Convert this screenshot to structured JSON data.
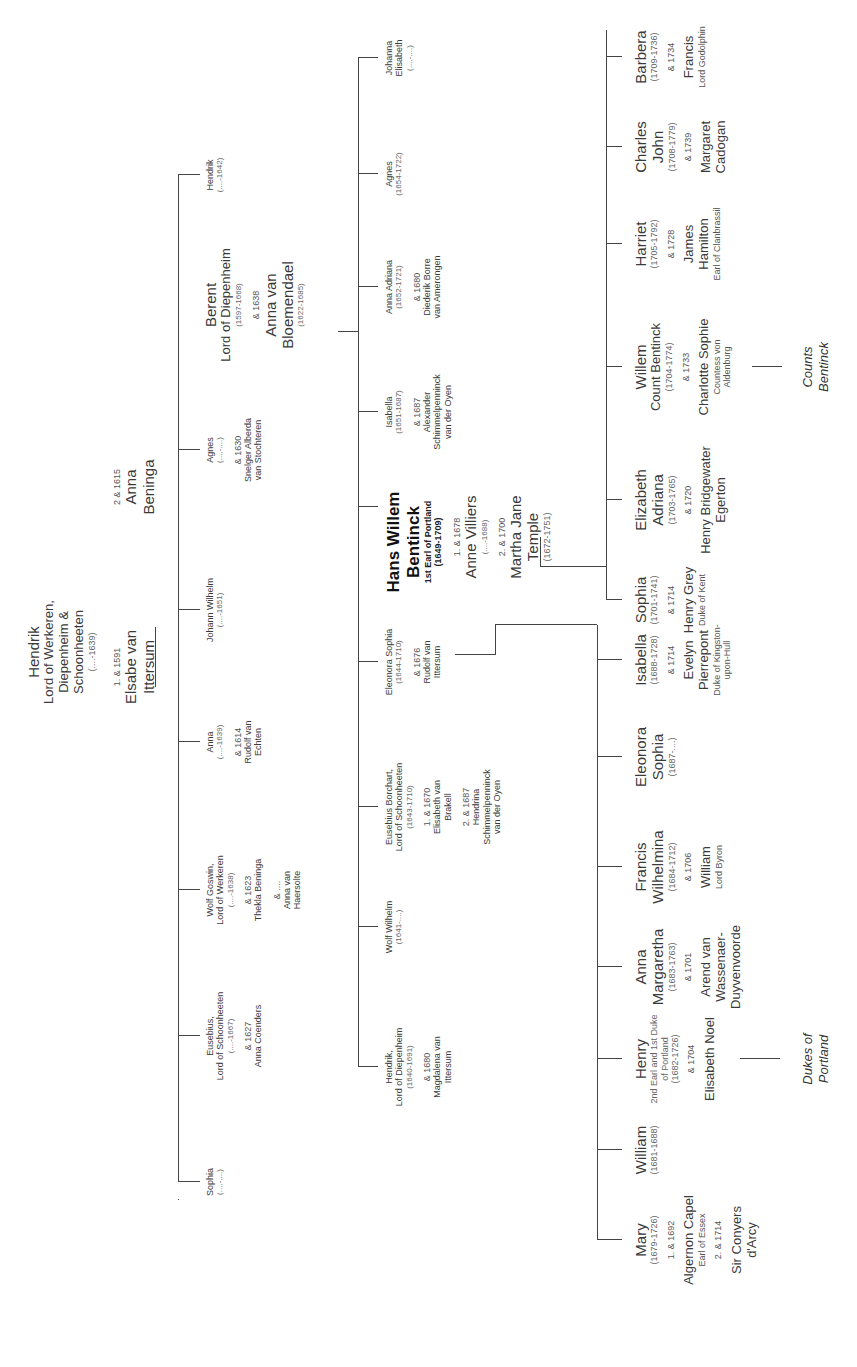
{
  "root": {
    "name": "Hendrik",
    "title_lines": [
      "Lord of Werkeren,",
      "Diepenheim &",
      "Schoonheeten"
    ],
    "years": "(....-1639)",
    "marriage1": "1. & 1591",
    "spouse1": [
      "Elsabe van",
      "Ittersum"
    ],
    "marriage2": "2 & 1615",
    "spouse2": [
      "Anna",
      "Beninga"
    ]
  },
  "generation2": [
    {
      "name": "Sophia",
      "years": "(....-....)"
    },
    {
      "name": "Eusebius,",
      "sub": "Lord of Schoonheeten",
      "years": "(....-1667)",
      "marriage": "& 1627",
      "spouse": [
        "Anna Coenders"
      ]
    },
    {
      "name": "Wolf Goswin,",
      "sub": "Lord of Werkeren",
      "years": "(....-1638)",
      "marriage": "& 1623",
      "spouse": [
        "Thekla Beninga"
      ],
      "marriage2": "& ....",
      "spouse2": [
        "Anna van",
        "Haersolte"
      ]
    },
    {
      "name": "Anna",
      "years": "(....-1639)",
      "marriage": "& 1614",
      "spouse": [
        "Rudolf van",
        "Echten"
      ]
    },
    {
      "name": "Johann Wilhelm",
      "years": "(....-1651)"
    },
    {
      "name": "Agnes",
      "years": "(....-....)",
      "marriage": "& 1630",
      "spouse": [
        "Snelger Alberda",
        "van Stochteren"
      ]
    },
    {
      "name": "Berent",
      "sub": "Lord of Diepenheim",
      "years": "(1597-1668)",
      "marriage": "& 1638",
      "spouse": [
        "Anna van",
        "Bloemendael"
      ],
      "spouse_years": "(1622-1685)"
    },
    {
      "name": "Hendrik",
      "years": "(....-1642)"
    }
  ],
  "generation3": [
    {
      "name": "Hendrik,",
      "sub": "Lord of Diepenheim",
      "years": "(1640-1691)",
      "marriage": "& 1680",
      "spouse": [
        "Magdalena van",
        "Ittersum"
      ]
    },
    {
      "name": "Wolf Wilhelm",
      "years": "(1641-....)"
    },
    {
      "name": "Eusebius Borchart,",
      "sub": "Lord of Schoonheeten",
      "years": "(1643-1710)",
      "marriage": "1. & 1670",
      "spouse": [
        "Elisabeth van",
        "Brakell"
      ],
      "marriage2": "2. & 1687",
      "spouse2": [
        "Hendrina",
        "Schimmelpenninck",
        "van der Oyen"
      ]
    },
    {
      "name": "Eleonora Sophia",
      "years": "(1644-1710)",
      "marriage": "& 1676",
      "spouse": [
        "Rudolf van",
        "Ittersum"
      ]
    },
    {
      "name": "Hans Willem",
      "name2": "Bentinck",
      "sub": "1st Earl of Portland",
      "years": "(1649-1709)",
      "marriage": "1. & 1678",
      "spouse": [
        "Anne Villiers"
      ],
      "spouse_years": "(....-1688)",
      "marriage2": "2. & 1700",
      "spouse2": [
        "Martha Jane",
        "Temple"
      ],
      "spouse2_years": "(1672-1751)"
    },
    {
      "name": "Isabella",
      "years": "(1651-1687)",
      "marriage": "& 1687",
      "spouse": [
        "Alexander",
        "Schimmelpenninck",
        "van der Oyen"
      ]
    },
    {
      "name": "Anna Adriana",
      "years": "(1652-1721)",
      "marriage": "& 1680",
      "spouse": [
        "Diederik Borre",
        "van Amerongen"
      ]
    },
    {
      "name": "Agnes",
      "years": "(1654-1722)"
    },
    {
      "name": "Johanna",
      "name2": "Elisabeth",
      "years": "(....-....)"
    }
  ],
  "generation4_first_marriage": [
    {
      "name": [
        "Mary"
      ],
      "years": "(1679-1726)",
      "marriage": "1. & 1692",
      "spouse": [
        "Algernon Capel"
      ],
      "spouse_title": "Earl of Essex",
      "marriage2": "2. & 1714",
      "spouse2": [
        "Sir Conyers",
        "d'Arcy"
      ]
    },
    {
      "name": [
        "William"
      ],
      "years": "(1681-1688)"
    },
    {
      "name": [
        "Henry"
      ],
      "sub": [
        "2nd Earl and 1st Duke",
        "of Portland"
      ],
      "years": "(1682-1726)",
      "marriage": "& 1704",
      "spouse": [
        "Elisabeth Noel"
      ]
    },
    {
      "name": [
        "Anna",
        "Margaretha"
      ],
      "years": "(1683-1763)",
      "marriage": "& 1701",
      "spouse": [
        "Arend van",
        "Wassenaer-",
        "Duyvenvoorde"
      ]
    },
    {
      "name": [
        "Francis",
        "Wilhelmina"
      ],
      "years": "(1684-1712)",
      "marriage": "& 1706",
      "spouse": [
        "William"
      ],
      "spouse_title": "Lord Byron"
    },
    {
      "name": [
        "Eleonora",
        "Sophia"
      ],
      "years": "(1687-....)"
    },
    {
      "name": [
        "Isabella"
      ],
      "years": "(1688-1728)",
      "marriage": "& 1714",
      "spouse": [
        "Evelyn",
        "Pierrepont"
      ],
      "spouse_title": "Duke of Kingston-upon-Hull"
    }
  ],
  "generation4_second_marriage": [
    {
      "name": [
        "Sophia"
      ],
      "years": "(1701-1741)",
      "marriage": "& 1714",
      "spouse": [
        "Henry Grey"
      ],
      "spouse_title": "Duke of Kent"
    },
    {
      "name": [
        "Elizabeth",
        "Adriana"
      ],
      "years": "(1703-1765)",
      "marriage": "& 1720",
      "spouse": [
        "Henry Bridgewater",
        "Egerton"
      ]
    },
    {
      "name": [
        "Willem",
        "Count Bentinck"
      ],
      "years": "(1704-1774)",
      "marriage": "& 1733",
      "spouse": [
        "Charlotte Sophie"
      ],
      "spouse_title": "Countess von Aldenburg"
    },
    {
      "name": [
        "Harriet"
      ],
      "years": "(1705-1792)",
      "marriage": "& 1728",
      "spouse": [
        "James",
        "Hamilton"
      ],
      "spouse_title": "Earl of Clanbrassil"
    },
    {
      "name": [
        "Charles",
        "John"
      ],
      "years": "(1708-1779)",
      "marriage": "& 1739",
      "spouse": [
        "Margaret",
        "Cadogan"
      ]
    },
    {
      "name": [
        "Barbera"
      ],
      "years": "(1709-1736)",
      "marriage": "& 1734",
      "spouse": [
        "Francis"
      ],
      "spouse_title": "Lord Godolphin"
    }
  ],
  "labels": {
    "dukes": [
      "Dukes of",
      "Portland"
    ],
    "counts": [
      "Counts",
      "Bentinck"
    ]
  },
  "colors": {
    "line": "#444444",
    "text": "#3a3a3a",
    "background": "#ffffff"
  }
}
